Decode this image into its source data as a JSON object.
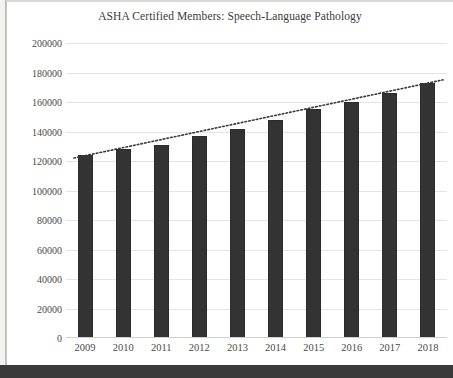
{
  "chart_data": {
    "type": "bar",
    "title": "ASHA Certified Members: Speech-Language Pathology",
    "xlabel": "",
    "ylabel": "",
    "categories": [
      "2009",
      "2010",
      "2011",
      "2012",
      "2013",
      "2014",
      "2015",
      "2016",
      "2017",
      "2018"
    ],
    "values": [
      124000,
      128000,
      131000,
      137000,
      142000,
      148000,
      155000,
      160000,
      166000,
      173000
    ],
    "series": [
      {
        "name": "ASHA Certified Members",
        "values": [
          124000,
          128000,
          131000,
          137000,
          142000,
          148000,
          155000,
          160000,
          166000,
          173000
        ]
      }
    ],
    "trendline": {
      "style": "dotted",
      "color": "#3a3a3a",
      "start_value": 122000,
      "end_value": 175000
    },
    "ylim": [
      0,
      200000
    ],
    "ytick_values": [
      0,
      20000,
      40000,
      60000,
      80000,
      100000,
      120000,
      140000,
      160000,
      180000,
      200000
    ],
    "ytick_labels": [
      "0",
      "20000",
      "40000",
      "60000",
      "80000",
      "100000",
      "120000",
      "140000",
      "160000",
      "180000",
      "200000"
    ],
    "grid": true,
    "legend": "none",
    "bar_color": "#333333",
    "gridline_color": "#e4e4e2"
  }
}
